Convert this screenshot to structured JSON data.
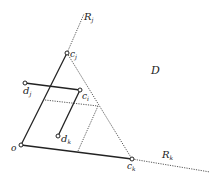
{
  "diagram": {
    "region_label": "D",
    "rays": [
      {
        "name": "R_j",
        "base": "R",
        "sub": "j"
      },
      {
        "name": "R_k",
        "base": "R",
        "sub": "k"
      }
    ],
    "points": {
      "o": {
        "base": "o",
        "sub": ""
      },
      "c_j": {
        "base": "c",
        "sub": "j"
      },
      "c_i": {
        "base": "c",
        "sub": "i"
      },
      "c_k": {
        "base": "c",
        "sub": "k"
      },
      "d_j": {
        "base": "d",
        "sub": "j"
      },
      "d_k": {
        "base": "d",
        "sub": "k"
      }
    },
    "colors": {
      "line": "#222222",
      "dotted": "#444444"
    }
  }
}
